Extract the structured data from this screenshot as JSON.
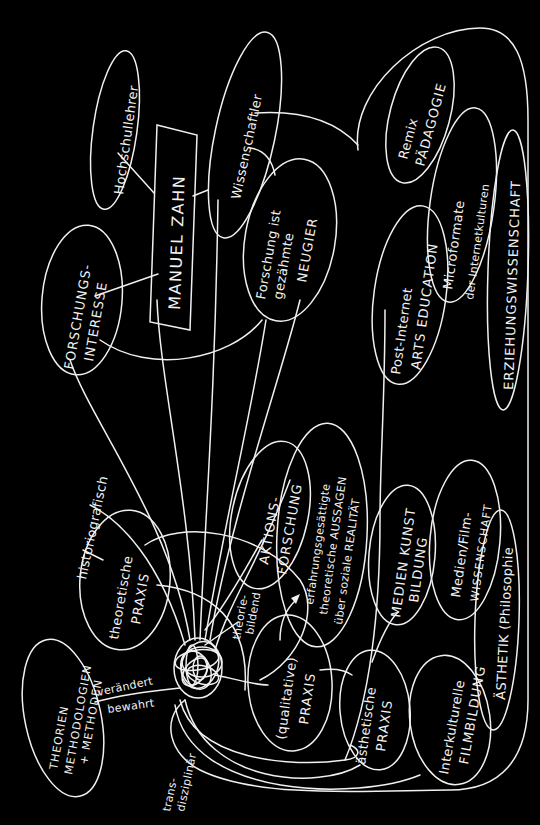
{
  "diagram": {
    "type": "hand-drawn concept map",
    "orientation": "rotated 90° counter-clockwise",
    "colors": {
      "background": "#000000",
      "stroke": "#f0f0f0"
    },
    "center": {
      "label": "MANUEL ZAHN",
      "shape": "rectangle"
    },
    "nodes": {
      "hochschullehrer": "Hochschullehrer",
      "wissenschaftler": "Wissenschaftler",
      "forschungsinteresse_1": "FORSCHUNGS-",
      "forschungsinteresse_2": "INTERESSE",
      "neugier_1": "Forschung ist",
      "neugier_2": "gezähmte",
      "neugier_3": "NEUGIER",
      "remix_1": "Remix",
      "remix_2": "PÄDAGOGIE",
      "microformate_1": "Microformate",
      "microformate_2": "der Internetkulturen",
      "erziehungswissenschaft": "ERZIEHUNGSWISSENSCHAFT",
      "postinternet_1": "Post-Internet",
      "postinternet_2": "ARTS EDUCATION",
      "theorien_1": "THEORIEN",
      "theorien_2": "METHODOLOGIEN",
      "theorien_3": "+ METHODEN",
      "theoretische_1": "theoretische",
      "theoretische_2": "PRAXIS",
      "aktionsforschung_1": "AKTIONS-",
      "aktionsforschung_2": "FORSCHUNG",
      "aussagen_1": "erfahrungsgesättigte",
      "aussagen_2": "theoretische AUSSAGEN",
      "aussagen_3": "über soziale REALITÄT",
      "qualitative_1": "(qualitative)",
      "qualitative_2": "PRAXIS",
      "aesthetische_1": "ästhetische",
      "aesthetische_2": "PRAXIS",
      "medienkunst_1": "MEDIEN KUNST",
      "medienkunst_2": "BILDUNG",
      "medienfilm_1": "Medien/Film-",
      "medienfilm_2": "WISSENSCHAFT",
      "aesthetik": "ÄSTHETIK (Philosophie",
      "filmbildung_1": "Interkulturelle",
      "filmbildung_2": "FILMBILDUNG"
    },
    "annotations": {
      "historiografisch": "historiografisch",
      "theoriebildend_1": "theorie-",
      "theoriebildend_2": "bildend",
      "veraendert": "verändert",
      "bewahrt": "bewahrt",
      "transdisziplinaer_1": "trans-",
      "transdisziplinaer_2": "disziplinär"
    }
  }
}
